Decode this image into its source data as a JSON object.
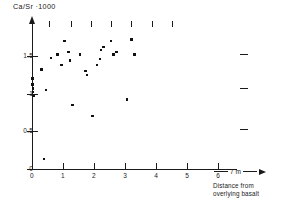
{
  "chart_data": {
    "type": "scatter",
    "title": "Ca/Sr ·1000",
    "xlabel": "Distance from overlying basalt",
    "xunit": "7 m",
    "ylabel": "Ca/Sr ·1000",
    "xlim": [
      0,
      6.6
    ],
    "ylim": [
      0,
      1.95
    ],
    "grid": false,
    "legend": null,
    "xticks": [
      "0",
      "1",
      "2",
      "3",
      "4",
      "5",
      "6"
    ],
    "xtick_values": [
      0,
      1,
      2,
      3,
      4,
      5,
      6
    ],
    "yticks": [
      "1.5",
      "1",
      "0.5",
      "0"
    ],
    "ytick_values": [
      1.5,
      1.0,
      0.5,
      0.0
    ],
    "points": [
      {
        "x": 0.02,
        "y": 1.2
      },
      {
        "x": 0.02,
        "y": 1.12
      },
      {
        "x": 0.04,
        "y": 1.07
      },
      {
        "x": 0.03,
        "y": 1.02
      },
      {
        "x": 0.05,
        "y": 0.97
      },
      {
        "x": 0.3,
        "y": 1.32
      },
      {
        "x": 0.38,
        "y": 0.13
      },
      {
        "x": 0.45,
        "y": 1.05
      },
      {
        "x": 0.62,
        "y": 1.47
      },
      {
        "x": 0.82,
        "y": 1.52
      },
      {
        "x": 0.95,
        "y": 1.38
      },
      {
        "x": 1.05,
        "y": 1.7
      },
      {
        "x": 1.18,
        "y": 1.55
      },
      {
        "x": 1.22,
        "y": 1.44
      },
      {
        "x": 1.3,
        "y": 0.85
      },
      {
        "x": 1.55,
        "y": 1.52
      },
      {
        "x": 1.72,
        "y": 1.3
      },
      {
        "x": 1.78,
        "y": 1.25
      },
      {
        "x": 1.95,
        "y": 0.7
      },
      {
        "x": 2.1,
        "y": 1.38
      },
      {
        "x": 2.18,
        "y": 1.46
      },
      {
        "x": 2.22,
        "y": 1.58
      },
      {
        "x": 2.3,
        "y": 1.62
      },
      {
        "x": 2.55,
        "y": 1.7
      },
      {
        "x": 2.62,
        "y": 1.52
      },
      {
        "x": 2.72,
        "y": 1.55
      },
      {
        "x": 3.05,
        "y": 0.92
      },
      {
        "x": 3.2,
        "y": 1.72
      },
      {
        "x": 3.3,
        "y": 1.52
      }
    ],
    "top_tick_values": [
      0.55,
      1.25,
      1.9,
      2.55,
      3.2,
      3.85,
      4.5
    ],
    "right_dash_values": [
      1.52,
      1.08,
      0.53
    ]
  },
  "caption": {
    "line1": "Distance from",
    "line2": "overlying basalt"
  }
}
